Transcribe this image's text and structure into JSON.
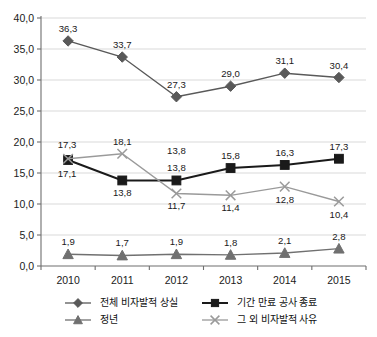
{
  "chart_data": {
    "type": "line",
    "title": "",
    "subtitle": "",
    "xlabel": "",
    "ylabel": "",
    "categories": [
      "2010",
      "2011",
      "2012",
      "2013",
      "2014",
      "2015"
    ],
    "ylim": [
      0,
      40
    ],
    "ytick_values": [
      0,
      5,
      10,
      15,
      20,
      25,
      30,
      35,
      40
    ],
    "ytick_labels": [
      "0,0",
      "5,0",
      "10,0",
      "15,0",
      "20,0",
      "25,0",
      "30,0",
      "35,0",
      "40,0"
    ],
    "grid": true,
    "grid_axis": "y",
    "legend_position": "bottom",
    "decimal_separator": ",",
    "series": [
      {
        "name": "전체 비자발적 상실",
        "marker": "diamond",
        "color": "#595959",
        "line_color": "#595959",
        "values": [
          36.3,
          33.7,
          27.3,
          29.0,
          31.1,
          30.4
        ],
        "labels": [
          "36,3",
          "33,7",
          "27,3",
          "29,0",
          "31,1",
          "30,4"
        ],
        "label_positions": [
          "above",
          "above",
          "above",
          "above",
          "above",
          "above"
        ]
      },
      {
        "name": "기간 만료 공사 종료",
        "marker": "square",
        "color": "#1a1a1a",
        "line_color": "#1a1a1a",
        "values": [
          17.1,
          13.8,
          13.8,
          15.8,
          16.3,
          17.3
        ],
        "labels": [
          "17,1",
          "13,8",
          "13,8",
          "15,8",
          "16,3",
          "17,3"
        ],
        "label_positions": [
          "below",
          "below",
          "above",
          "above",
          "above",
          "above"
        ]
      },
      {
        "name": "정년",
        "marker": "triangle",
        "color": "#707070",
        "line_color": "#707070",
        "values": [
          1.9,
          1.7,
          1.9,
          1.8,
          2.1,
          2.8
        ],
        "labels": [
          "1,9",
          "1,7",
          "1,9",
          "1,8",
          "2,1",
          "2,8"
        ],
        "label_positions": [
          "above",
          "above",
          "above",
          "above",
          "above",
          "above"
        ]
      },
      {
        "name": "그 외 비자발적 사유",
        "marker": "x",
        "color": "#9a9a9a",
        "line_color": "#9a9a9a",
        "values": [
          17.3,
          18.1,
          11.7,
          11.4,
          12.8,
          10.4
        ],
        "labels": [
          "17,3",
          "18,1",
          "13,8",
          "11,7",
          "11,4",
          "12,8",
          "10,4"
        ],
        "label_positions": [
          "above",
          "above",
          "below",
          "below",
          "below",
          "below"
        ]
      }
    ],
    "point_labels": {
      "diamond": [
        "36,3",
        "33,7",
        "27,3",
        "29,0",
        "31,1",
        "30,4"
      ],
      "square": [
        "17,1",
        "13,8",
        "13,8",
        "15,8",
        "16,3",
        "17,3"
      ],
      "triangle": [
        "1,9",
        "1,7",
        "1,9",
        "1,8",
        "2,1",
        "2,8"
      ],
      "x": [
        "17,3",
        "18,1",
        "11,7",
        "11,4",
        "12,8",
        "10,4"
      ]
    },
    "extra_annotations": [
      "13,8"
    ]
  },
  "legend": {
    "entries": [
      {
        "label": "전체 비자발적 상실",
        "marker": "diamond",
        "color": "#595959"
      },
      {
        "label": "기간 만료 공사 종료",
        "marker": "square",
        "color": "#1a1a1a"
      },
      {
        "label": "정년",
        "marker": "triangle",
        "color": "#707070"
      },
      {
        "label": "그 외 비자발적 사유",
        "marker": "x",
        "color": "#9a9a9a"
      }
    ]
  },
  "colors": {
    "background": "#ffffff",
    "grid": "#d9d9d9",
    "axis": "#6e6e6e",
    "text": "#1a1a1a"
  }
}
